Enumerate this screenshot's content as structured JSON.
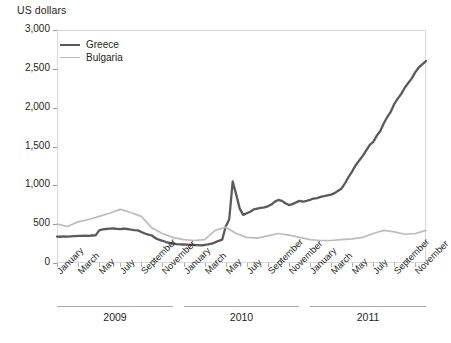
{
  "chart_data": {
    "type": "line",
    "title": "US dollars",
    "xlabel": "",
    "ylabel": "US dollars",
    "ylim": [
      0,
      3000
    ],
    "yticks": [
      0,
      500,
      1000,
      1500,
      2000,
      2500,
      3000
    ],
    "ytick_labels": [
      "0",
      "500",
      "1,000",
      "1,500",
      "2,000",
      "2,500",
      "3,000"
    ],
    "grid": false,
    "legend_position": "top-left",
    "legend": [
      "Greece",
      "Bulgaria"
    ],
    "x": [
      "2009-01",
      "2009-02",
      "2009-03",
      "2009-04",
      "2009-05",
      "2009-06",
      "2009-07",
      "2009-08",
      "2009-09",
      "2009-10",
      "2009-11",
      "2009-12",
      "2010-01",
      "2010-02",
      "2010-03",
      "2010-04",
      "2010-05",
      "2010-06",
      "2010-07",
      "2010-08",
      "2010-09",
      "2010-10",
      "2010-11",
      "2010-12",
      "2011-01",
      "2011-02",
      "2011-03",
      "2011-04",
      "2011-05",
      "2011-06",
      "2011-07",
      "2011-08",
      "2011-09",
      "2011-10",
      "2011-11",
      "2011-12"
    ],
    "xtick_labels": [
      "January",
      "March",
      "May",
      "July",
      "September",
      "November",
      "January",
      "March",
      "May",
      "July",
      "September",
      "November",
      "January",
      "March",
      "May",
      "July",
      "September",
      "November"
    ],
    "year_groups": [
      {
        "label": "2009",
        "start": "2009-01",
        "end": "2009-12"
      },
      {
        "label": "2010",
        "start": "2010-01",
        "end": "2010-12"
      },
      {
        "label": "2011",
        "start": "2011-01",
        "end": "2011-12"
      }
    ],
    "series": [
      {
        "name": "Greece",
        "color": "#5a5a5a",
        "width": 2.3,
        "values": [
          340,
          345,
          350,
          355,
          430,
          440,
          440,
          425,
          360,
          300,
          245,
          240,
          235,
          230,
          250,
          300,
          620,
          560,
          700,
          720,
          780,
          820,
          760,
          800,
          830,
          860,
          880,
          960,
          1180,
          1380,
          1550,
          1700,
          1950,
          2180,
          2380,
          2600
        ],
        "daily_detail": [
          340,
          338,
          342,
          340,
          344,
          346,
          348,
          350,
          352,
          350,
          354,
          356,
          420,
          432,
          438,
          442,
          444,
          440,
          436,
          442,
          438,
          430,
          424,
          420,
          400,
          380,
          366,
          354,
          320,
          300,
          286,
          270,
          258,
          248,
          242,
          240,
          238,
          236,
          234,
          232,
          230,
          228,
          232,
          240,
          250,
          266,
          286,
          300,
          470,
          560,
          1050,
          880,
          700,
          620,
          640,
          660,
          690,
          700,
          710,
          716,
          730,
          752,
          790,
          812,
          800,
          770,
          746,
          758,
          780,
          800,
          790,
          800,
          812,
          830,
          836,
          852,
          860,
          872,
          880,
          900,
          930,
          960,
          1030,
          1110,
          1180,
          1260,
          1320,
          1380,
          1450,
          1520,
          1560,
          1640,
          1700,
          1800,
          1880,
          1950,
          2050,
          2120,
          2180,
          2260,
          2320,
          2380,
          2460,
          2520,
          2560,
          2600
        ]
      },
      {
        "name": "Bulgaria",
        "color": "#bcbcbc",
        "width": 1.7,
        "values": [
          500,
          470,
          530,
          560,
          600,
          640,
          690,
          650,
          600,
          450,
          380,
          330,
          300,
          290,
          300,
          420,
          460,
          380,
          330,
          320,
          350,
          380,
          360,
          330,
          300,
          290,
          290,
          300,
          310,
          330,
          380,
          420,
          400,
          370,
          380,
          420
        ]
      }
    ]
  }
}
